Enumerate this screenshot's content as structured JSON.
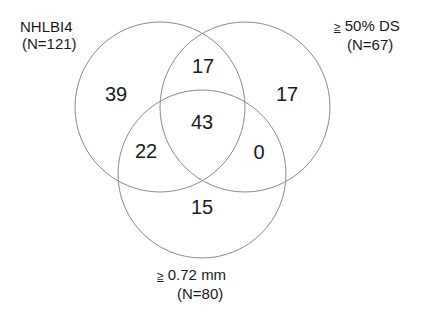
{
  "diagram": {
    "type": "venn3",
    "sets": [
      {
        "id": "A",
        "name": "NHLBI4",
        "n_label": "(N=121)",
        "cx": 160,
        "cy": 107,
        "r": 85
      },
      {
        "id": "B",
        "name_prefix": "≥",
        "name": "50% DS",
        "n_label": "(N=67)",
        "cx": 245,
        "cy": 107,
        "r": 85
      },
      {
        "id": "C",
        "name_prefix": "≥",
        "name": "0.72 mm",
        "n_label": "(N=80)",
        "cx": 202,
        "cy": 174,
        "r": 84
      }
    ],
    "regions": {
      "A_only": "39",
      "AB_only": "17",
      "B_only": "17",
      "ABC": "43",
      "AC_only": "22",
      "BC_only": "0",
      "C_only": "15"
    },
    "stroke_color": "#8a8a8a",
    "text_color": "#1a1a1a"
  }
}
